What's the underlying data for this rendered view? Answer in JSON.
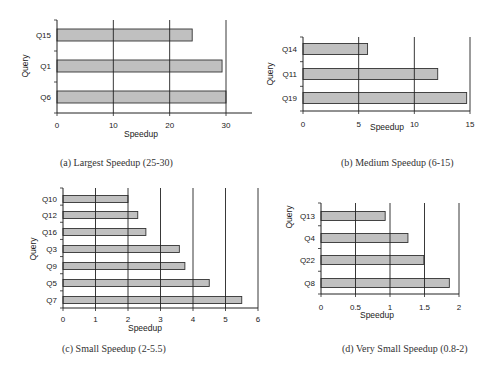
{
  "chart_data": [
    {
      "id": "a",
      "type": "bar",
      "orientation": "horizontal",
      "caption": "(a) Largest Speedup (25-30)",
      "title": "",
      "xlabel": "Speedup",
      "ylabel": "Query",
      "categories": [
        "Q15",
        "Q1",
        "Q6"
      ],
      "values": [
        24,
        29.3,
        30
      ],
      "xlim": [
        0,
        30
      ],
      "xticks": [
        0,
        10,
        20,
        30
      ],
      "grid": "vertical",
      "legend": null,
      "bar_color": "#c0c0c0",
      "layout": {
        "x0": 57,
        "x1": 226,
        "axis_end": 252,
        "y_top": 20,
        "y_bottom": 113,
        "bar_h": 12,
        "centers": [
          35,
          66,
          97
        ],
        "ylabel_x": 28,
        "ylabel_y": 66,
        "xtitle_x": 141,
        "xtitle_y": 137,
        "ticks_y": 128
      }
    },
    {
      "id": "b",
      "type": "bar",
      "orientation": "horizontal",
      "caption": "(b) Medium Speedup (6-15)",
      "title": "",
      "xlabel": "Speedup",
      "ylabel": "Query",
      "categories": [
        "Q14",
        "Q11",
        "Q19"
      ],
      "values": [
        5.8,
        12.1,
        14.7
      ],
      "xlim": [
        0,
        15
      ],
      "xticks": [
        0,
        5,
        10,
        15
      ],
      "grid": "vertical",
      "legend": null,
      "bar_color": "#c0c0c0",
      "layout": {
        "x0": 303,
        "x1": 470,
        "axis_end": 470,
        "y_top": 37,
        "y_bottom": 111,
        "bar_h": 11,
        "centers": [
          49,
          74,
          98
        ],
        "ylabel_x": 273,
        "ylabel_y": 74,
        "xtitle_x": 387,
        "xtitle_y": 130,
        "ticks_y": 127
      }
    },
    {
      "id": "c",
      "type": "bar",
      "orientation": "horizontal",
      "caption": "(c) Small Speedup (2-5.5)",
      "title": "",
      "xlabel": "Speedup",
      "ylabel": "Query",
      "categories": [
        "Q10",
        "Q12",
        "Q16",
        "Q3",
        "Q9",
        "Q5",
        "Q7"
      ],
      "values": [
        2.0,
        2.3,
        2.55,
        3.58,
        3.75,
        4.5,
        5.5
      ],
      "xlim": [
        0,
        6
      ],
      "xticks": [
        0,
        1,
        2,
        3,
        4,
        5,
        6
      ],
      "grid": "vertical",
      "legend": null,
      "bar_color": "#c0c0c0",
      "layout": {
        "x0": 63,
        "x1": 258,
        "axis_end": 258,
        "y_top": 188,
        "y_bottom": 308,
        "bar_h": 7,
        "centers": [
          199,
          215,
          232,
          249,
          266,
          283,
          300
        ],
        "ylabel_x": 36,
        "ylabel_y": 249,
        "xtitle_x": 145,
        "xtitle_y": 331,
        "ticks_y": 322
      }
    },
    {
      "id": "d",
      "type": "bar",
      "orientation": "horizontal",
      "caption": "(d) Very Small Speedup (0.8-2)",
      "title": "",
      "xlabel": "Speedup",
      "ylabel": "Query",
      "categories": [
        "Q13",
        "Q4",
        "Q22",
        "Q8"
      ],
      "values": [
        0.93,
        1.26,
        1.49,
        1.86
      ],
      "xlim": [
        0,
        2
      ],
      "xticks": [
        0,
        0.5,
        1,
        1.5,
        2
      ],
      "grid": "vertical",
      "legend": null,
      "bar_color": "#c0c0c0",
      "layout": {
        "x0": 321,
        "x1": 459,
        "axis_end": 459,
        "y_top": 203,
        "y_bottom": 294,
        "bar_h": 9,
        "centers": [
          216,
          238,
          260,
          283
        ],
        "ylabel_x": 292,
        "ylabel_y": 217,
        "xtitle_x": 377,
        "xtitle_y": 318,
        "ticks_y": 310
      }
    }
  ],
  "captions": {
    "a": "(a) Largest Speedup (25-30)",
    "b": "(b) Medium Speedup (6-15)",
    "c": "(c) Small Speedup (2-5.5)",
    "d": "(d) Very Small Speedup (0.8-2)"
  }
}
